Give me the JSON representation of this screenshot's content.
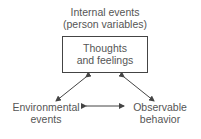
{
  "diagram": {
    "top_label": {
      "line1": "Internal events",
      "line2": "(person variables)"
    },
    "central_box": {
      "line1": "Thoughts",
      "line2": "and feelings"
    },
    "left_node": {
      "line1": "Environmental",
      "line2": "events"
    },
    "right_node": {
      "line1": "Observable",
      "line2": "behavior"
    },
    "arrows": [
      {
        "from": "central_box",
        "to": "left_node",
        "type": "bidirectional"
      },
      {
        "from": "central_box",
        "to": "right_node",
        "type": "bidirectional"
      },
      {
        "from": "left_node",
        "to": "right_node",
        "type": "bidirectional"
      }
    ],
    "colors": {
      "text": "#555555",
      "lines": "#444444"
    }
  }
}
